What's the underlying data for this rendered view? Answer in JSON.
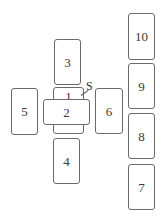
{
  "diagram": {
    "title": "",
    "type": "card-spread-layout",
    "cards": [
      {
        "id": "1",
        "label": "1",
        "orientation": "vertical",
        "position": "center"
      },
      {
        "id": "2",
        "label": "2",
        "orientation": "horizontal",
        "position": "center-crossing"
      },
      {
        "id": "3",
        "label": "3",
        "orientation": "vertical",
        "position": "above"
      },
      {
        "id": "4",
        "label": "4",
        "orientation": "vertical",
        "position": "below"
      },
      {
        "id": "5",
        "label": "5",
        "orientation": "vertical",
        "position": "left"
      },
      {
        "id": "6",
        "label": "6",
        "orientation": "vertical",
        "position": "right"
      },
      {
        "id": "7",
        "label": "7",
        "orientation": "vertical",
        "position": "column-bottom"
      },
      {
        "id": "8",
        "label": "8",
        "orientation": "vertical",
        "position": "column-lower-middle"
      },
      {
        "id": "9",
        "label": "9",
        "orientation": "vertical",
        "position": "column-upper-middle"
      },
      {
        "id": "10",
        "label": "10",
        "orientation": "vertical",
        "position": "column-top"
      }
    ],
    "annotation": {
      "label": "S",
      "points_to": "1"
    }
  }
}
